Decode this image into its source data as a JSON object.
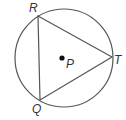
{
  "diagram": {
    "type": "inscribed-triangle-in-circle",
    "circle": {
      "cx": 64,
      "cy": 58,
      "r": 49,
      "stroke": "#555555"
    },
    "center": {
      "label": "P",
      "x": 62,
      "y": 58
    },
    "vertices": [
      {
        "label": "R",
        "x": 38,
        "y": 16
      },
      {
        "label": "T",
        "x": 112,
        "y": 57
      },
      {
        "label": "Q",
        "x": 40,
        "y": 100
      }
    ],
    "line_color": "#555555",
    "label_color": "#333333"
  }
}
